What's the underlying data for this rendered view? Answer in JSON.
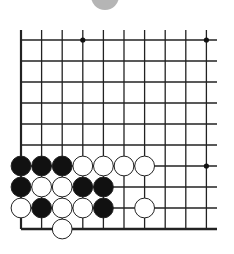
{
  "diagram": {
    "type": "go-board-fragment",
    "grid": {
      "columns": 10,
      "rows": 10,
      "origin_x": 21,
      "origin_y": 40,
      "spacing_x": 20.6,
      "spacing_y": 21,
      "right_extent_x": 217,
      "top_extent_y": 30,
      "left_edge": true,
      "bottom_edge": true,
      "line_color": "#222222",
      "faded_row_index": 2
    },
    "star_points": [
      {
        "col": 3,
        "row": 0
      },
      {
        "col": 9,
        "row": 0
      },
      {
        "col": 9,
        "row": 6
      }
    ],
    "stones": [
      {
        "color": "black",
        "col": 0,
        "row": 6
      },
      {
        "color": "black",
        "col": 1,
        "row": 6
      },
      {
        "color": "black",
        "col": 2,
        "row": 6
      },
      {
        "color": "white",
        "col": 3,
        "row": 6
      },
      {
        "color": "white",
        "col": 4,
        "row": 6
      },
      {
        "color": "white",
        "col": 5,
        "row": 6
      },
      {
        "color": "white",
        "col": 6,
        "row": 6
      },
      {
        "color": "black",
        "col": 0,
        "row": 7
      },
      {
        "color": "white",
        "col": 1,
        "row": 7
      },
      {
        "color": "white",
        "col": 2,
        "row": 7
      },
      {
        "color": "black",
        "col": 3,
        "row": 7
      },
      {
        "color": "black",
        "col": 4,
        "row": 7
      },
      {
        "color": "white",
        "col": 0,
        "row": 8
      },
      {
        "color": "black",
        "col": 1,
        "row": 8
      },
      {
        "color": "white",
        "col": 2,
        "row": 8
      },
      {
        "color": "white",
        "col": 3,
        "row": 8
      },
      {
        "color": "black",
        "col": 4,
        "row": 8
      },
      {
        "color": "white",
        "col": 6,
        "row": 8
      },
      {
        "color": "white",
        "col": 2,
        "row": 9
      }
    ],
    "top_marker": {
      "shape": "partial-circle",
      "cx": 105,
      "cy": -4,
      "r": 14,
      "color": "#b5b5b5"
    },
    "colors": {
      "black_stone": "#111111",
      "white_stone": "#ffffff",
      "stone_outline": "#222222",
      "background": "#ffffff"
    }
  }
}
